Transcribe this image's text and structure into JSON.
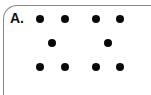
{
  "panel": {
    "label": "A.",
    "border_color": "#8a8a8a",
    "dot_color": "#0a0a0a",
    "dots": [
      {
        "x": 40,
        "y": 19
      },
      {
        "x": 65,
        "y": 19
      },
      {
        "x": 96,
        "y": 19
      },
      {
        "x": 120,
        "y": 19
      },
      {
        "x": 52,
        "y": 43
      },
      {
        "x": 108,
        "y": 43
      },
      {
        "x": 40,
        "y": 67
      },
      {
        "x": 65,
        "y": 67
      },
      {
        "x": 96,
        "y": 67
      },
      {
        "x": 120,
        "y": 67
      }
    ]
  }
}
